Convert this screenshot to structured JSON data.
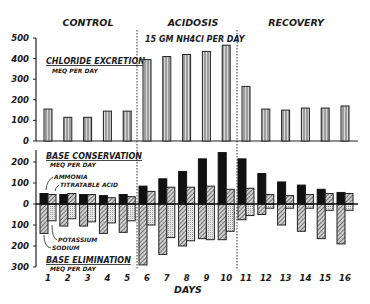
{
  "phases": [
    "CONTROL",
    "ACIDOSIS",
    "RECOVERY"
  ],
  "acidosis_note": "15 GM NH4Cl PER DAY",
  "top_panel": {
    "title": "CHLORIDE EXCRETION",
    "units": "MEQ PER DAY",
    "y_ticks": [
      "500",
      "400",
      "300",
      "200",
      "100",
      "0"
    ]
  },
  "bottom_panel": {
    "title_top": "BASE CONSERVATION",
    "units_top": "MEQ PER DAY",
    "title_bottom": "BASE ELIMINATION",
    "units_bottom": "MEQ PER DAY",
    "y_ticks": [
      "200",
      "100",
      "0",
      "100",
      "200",
      "300"
    ],
    "labels": {
      "ammonia": "AMMONIA",
      "titratable": "TITRATABLE ACID",
      "potassium": "POTASSIUM",
      "sodium": "SODIUM"
    }
  },
  "x_label": "DAYS",
  "days": [
    "1",
    "2",
    "3",
    "4",
    "5",
    "6",
    "7",
    "8",
    "9",
    "10",
    "11",
    "12",
    "13",
    "14",
    "15",
    "16"
  ],
  "chart_data": [
    {
      "type": "bar",
      "title": "CHLORIDE EXCRETION (MEQ PER DAY)",
      "xlabel": "DAYS",
      "ylabel": "MEQ PER DAY",
      "ylim": [
        0,
        500
      ],
      "categories": [
        "1",
        "2",
        "3",
        "4",
        "5",
        "6",
        "7",
        "8",
        "9",
        "10",
        "11",
        "12",
        "13",
        "14",
        "15",
        "16"
      ],
      "series": [
        {
          "name": "Chloride excretion",
          "values": [
            155,
            115,
            115,
            145,
            145,
            395,
            410,
            420,
            435,
            465,
            265,
            155,
            150,
            160,
            160,
            170
          ]
        }
      ],
      "phases": [
        {
          "name": "CONTROL",
          "days": [
            1,
            5
          ]
        },
        {
          "name": "ACIDOSIS",
          "days": [
            6,
            10
          ]
        },
        {
          "name": "RECOVERY",
          "days": [
            11,
            16
          ]
        }
      ],
      "grid": false
    },
    {
      "type": "bar",
      "title": "BASE CONSERVATION / BASE ELIMINATION (MEQ PER DAY)",
      "xlabel": "DAYS",
      "ylabel": "MEQ PER DAY",
      "ylim": [
        -300,
        250
      ],
      "categories": [
        "1",
        "2",
        "3",
        "4",
        "5",
        "6",
        "7",
        "8",
        "9",
        "10",
        "11",
        "12",
        "13",
        "14",
        "15",
        "16"
      ],
      "series": [
        {
          "name": "Ammonia",
          "values": [
            50,
            45,
            45,
            40,
            45,
            85,
            120,
            155,
            215,
            245,
            215,
            145,
            105,
            90,
            70,
            55
          ]
        },
        {
          "name": "Titratable Acid",
          "values": [
            45,
            50,
            45,
            30,
            35,
            60,
            80,
            80,
            85,
            70,
            75,
            45,
            40,
            45,
            50,
            50
          ]
        },
        {
          "name": "Sodium",
          "values": [
            -140,
            -105,
            -105,
            -140,
            -135,
            -290,
            -240,
            -200,
            -165,
            -170,
            -75,
            -50,
            -100,
            -130,
            -165,
            -190
          ]
        },
        {
          "name": "Potassium",
          "values": [
            -80,
            -70,
            -85,
            -90,
            -80,
            -100,
            -160,
            -175,
            -170,
            -130,
            -55,
            -20,
            -20,
            -20,
            -30,
            -30
          ]
        }
      ],
      "grid": false
    }
  ]
}
